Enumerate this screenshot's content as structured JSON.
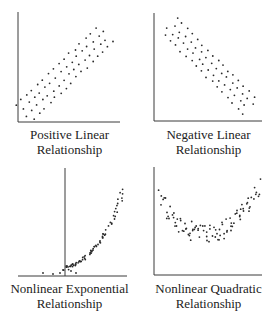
{
  "chart_data": [
    {
      "type": "scatter",
      "title": "Positive Linear Relationship",
      "caption_lines": [
        "Positive Linear",
        "Relationship"
      ],
      "pattern": "positive-linear",
      "axes": {
        "x0": 18,
        "y0": 122,
        "x1": 120,
        "ytop": 12,
        "yaxis_x": 18
      },
      "band": {
        "start": [
          24,
          113
        ],
        "end": [
          106,
          34
        ],
        "width": 11,
        "rows": 4,
        "cols": 16
      },
      "grid": false,
      "legend": null
    },
    {
      "type": "scatter",
      "title": "Negative Linear Relationship",
      "caption_lines": [
        "Negative Linear",
        "Relationship"
      ],
      "pattern": "negative-linear",
      "axes": {
        "x0": 154,
        "y0": 121,
        "x1": 262,
        "ytop": 13,
        "yaxis_x": 154
      },
      "band": {
        "start": [
          170,
          26
        ],
        "end": [
          250,
          106
        ],
        "width": 10,
        "rows": 4,
        "cols": 16
      },
      "grid": false,
      "legend": null
    },
    {
      "type": "scatter",
      "title": "Nonlinear Exponential Relationship",
      "caption_lines": [
        "Nonlinear Exponential",
        "Relationship"
      ],
      "pattern": "exponential",
      "axes": {
        "x0": 18,
        "y0": 276,
        "x1": 127,
        "ytop": 168,
        "yaxis_x": 65
      },
      "curve": {
        "xmin": 42,
        "xmax": 124,
        "ybase": 274,
        "ytop": 186,
        "k": 3.2,
        "width": 12
      },
      "grid": false,
      "legend": null
    },
    {
      "type": "scatter",
      "title": "Nonlinear Quadratic Relationship",
      "caption_lines": [
        "Nonlinear Quadratic",
        "Relationship"
      ],
      "pattern": "quadratic",
      "axes": {
        "x0": 154,
        "y0": 275,
        "x1": 262,
        "ytop": 167,
        "yaxis_x": 154
      },
      "curve": {
        "xmin": 160,
        "xmax": 264,
        "ymin_y": 234,
        "yend": 190,
        "width": 12
      },
      "grid": false,
      "legend": null
    }
  ],
  "style": {
    "axis_color": "#3a3a3a",
    "dot_color": "#2a2a2a",
    "dot_radius": 0.9
  },
  "captions": [
    {
      "line1": "Positive Linear",
      "line2": "Relationship"
    },
    {
      "line1": "Negative Linear",
      "line2": "Relationship"
    },
    {
      "line1": "Nonlinear Exponential",
      "line2": "Relationship"
    },
    {
      "line1": "Nonlinear Quadratic",
      "line2": "Relationship"
    }
  ]
}
